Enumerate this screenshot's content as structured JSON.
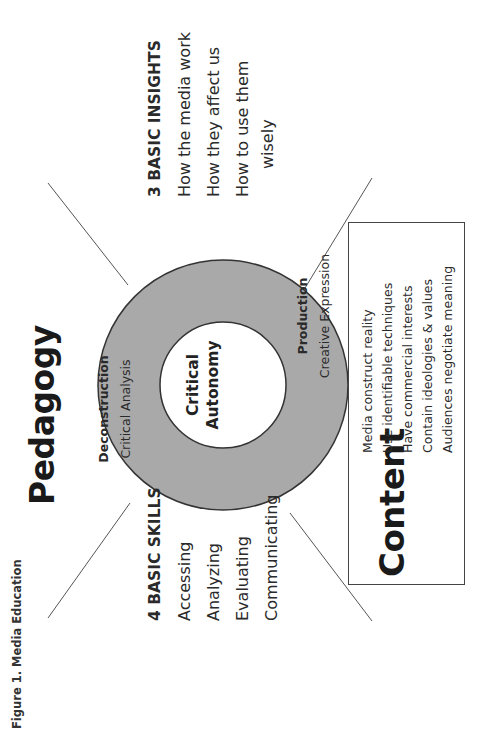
{
  "figure": {
    "caption": "Figure 1. Media Education",
    "title": "Pedagogy"
  },
  "skills": {
    "heading": "4 BASIC SKILLS",
    "items": [
      "Accessing",
      "Analyzing",
      "Evaluating",
      "Communicating"
    ]
  },
  "insights": {
    "heading": "3 BASIC INSIGHTS",
    "items": [
      "How the media work",
      "How they affect us",
      "How to use them",
      "wisely"
    ]
  },
  "ring": {
    "deconstruction": {
      "label": "Deconstruction",
      "sublabel": "Critical Analysis"
    },
    "production": {
      "label": "Production",
      "sublabel": "Creative Expression"
    }
  },
  "center": {
    "line1": "Critical",
    "line2": "Autonomy"
  },
  "content": {
    "title": "Content",
    "items": [
      "Media construct reality",
      "Use identifiable techniques",
      "Have commercial interests",
      "Contain ideologies & values",
      "Audiences negotiate meaning"
    ]
  },
  "colors": {
    "ring_fill": "#a9a9a9",
    "ring_stroke": "#333333",
    "inner_fill": "#ffffff",
    "line": "#555555",
    "text": "#222222"
  }
}
